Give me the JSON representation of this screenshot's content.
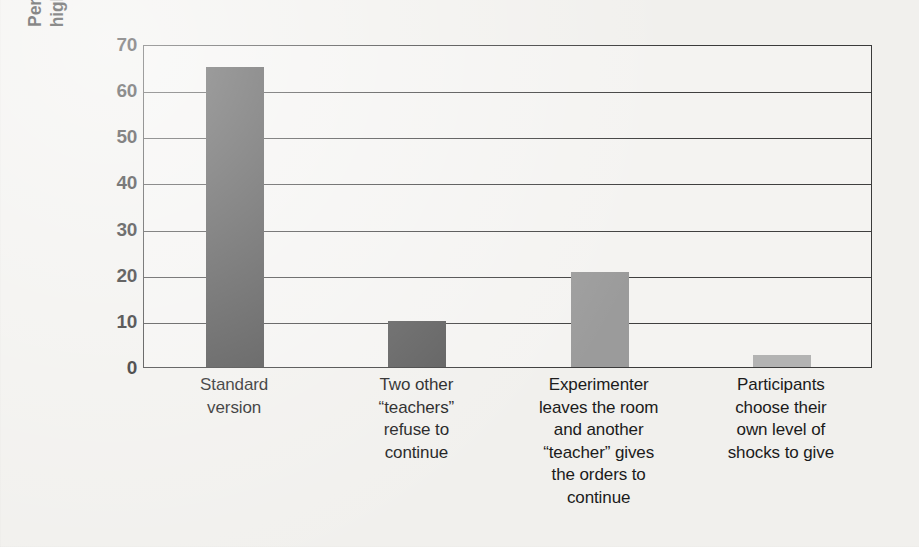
{
  "chart_data": {
    "type": "bar",
    "title": "",
    "subtitle": "",
    "xlabel": "",
    "ylabel": "Percentage giving the highest level of shock",
    "ylabel_lines": [
      "Percentage giving the",
      "highest level of shock"
    ],
    "ylim": [
      0,
      70
    ],
    "ytick_labels": [
      "70",
      "60",
      "50",
      "40",
      "30",
      "20",
      "10",
      "0"
    ],
    "ytick_values": [
      70,
      60,
      50,
      40,
      30,
      20,
      10,
      0
    ],
    "grid": "horizontal",
    "legend": "none",
    "categories": [
      "Standard version",
      "Two other “teachers” refuse to continue",
      "Experimenter leaves the room and another “teacher” gives the orders to continue",
      "Participants choose their own level of shocks to give"
    ],
    "category_label_lines": [
      [
        "Standard",
        "version"
      ],
      [
        "Two other",
        "“teachers”",
        "refuse to",
        "continue"
      ],
      [
        "Experimenter",
        "leaves the room",
        "and another",
        "“teacher” gives",
        "the orders to",
        "continue"
      ],
      [
        "Participants",
        "choose their",
        "own level of",
        "shocks to give"
      ]
    ],
    "values": [
      65,
      10,
      20.5,
      2.5
    ],
    "bar_colors": [
      "#484848",
      "#575757",
      "#9b9b9b",
      "#b3b3b3"
    ],
    "axis_color": "#3b3b3b",
    "background_color": "#f1f0ed",
    "text_color": "#1c1c1c"
  }
}
